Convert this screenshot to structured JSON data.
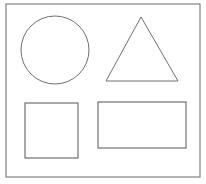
{
  "diagram": {
    "stroke_color": "#707070",
    "frame_color": "#808080",
    "background": "#ffffff",
    "shapes": [
      {
        "name": "circle",
        "cx": 55,
        "cy": 50,
        "r": 34
      },
      {
        "name": "triangle",
        "points": "141,17 106,81 178,81"
      },
      {
        "name": "square",
        "x": 25,
        "y": 103,
        "width": 53,
        "height": 55
      },
      {
        "name": "rectangle",
        "x": 98,
        "y": 102,
        "width": 88,
        "height": 46
      }
    ],
    "frame": {
      "x": 6,
      "y": 4,
      "width": 194,
      "height": 173
    }
  }
}
